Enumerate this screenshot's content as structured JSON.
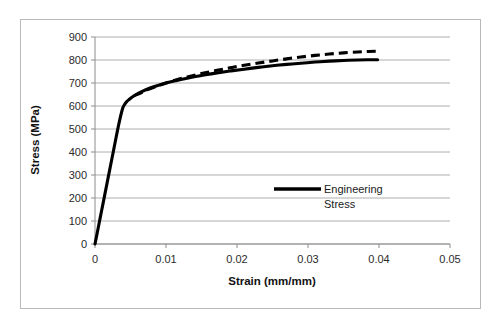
{
  "chart_data": {
    "type": "line",
    "title": "",
    "xlabel": "Strain (mm/mm)",
    "ylabel": "Stress (MPa)",
    "xlim": [
      0,
      0.05
    ],
    "ylim": [
      0,
      900
    ],
    "xticks": [
      "0",
      "0.01",
      "0.02",
      "0.03",
      "0.04",
      "0.05"
    ],
    "xtick_values": [
      0,
      0.01,
      0.02,
      0.03,
      0.04,
      0.05
    ],
    "yticks": [
      "0",
      "100",
      "200",
      "300",
      "400",
      "500",
      "600",
      "700",
      "800",
      "900"
    ],
    "ytick_values": [
      0,
      100,
      200,
      300,
      400,
      500,
      600,
      700,
      800,
      900
    ],
    "grid": "horizontal",
    "legend_position": "inside-right",
    "legend": [
      {
        "name": "Engineering Stress",
        "style": "solid",
        "color": "#000000"
      }
    ],
    "series": [
      {
        "name": "Engineering Stress",
        "style": "solid",
        "color": "#000000",
        "x": [
          0,
          0.0004,
          0.0009,
          0.0014,
          0.0019,
          0.0024,
          0.0029,
          0.0034,
          0.0039,
          0.0042,
          0.0045,
          0.0048,
          0.0052,
          0.0058,
          0.0065,
          0.0075,
          0.0085,
          0.01,
          0.0115,
          0.013,
          0.015,
          0.017,
          0.019,
          0.021,
          0.023,
          0.025,
          0.027,
          0.029,
          0.031,
          0.033,
          0.035,
          0.037,
          0.0385,
          0.0398
        ],
        "y": [
          0,
          62,
          140,
          218,
          296,
          374,
          452,
          528,
          590,
          608,
          620,
          628,
          638,
          650,
          661,
          675,
          686,
          700,
          711,
          721,
          733,
          743,
          752,
          760,
          768,
          775,
          781,
          786,
          791,
          795,
          798,
          800,
          801,
          801
        ]
      },
      {
        "name": "True Stress",
        "style": "dashed",
        "color": "#000000",
        "x": [
          0.0055,
          0.0065,
          0.0075,
          0.0085,
          0.01,
          0.0115,
          0.013,
          0.015,
          0.017,
          0.019,
          0.021,
          0.023,
          0.025,
          0.027,
          0.029,
          0.031,
          0.033,
          0.035,
          0.037,
          0.0385,
          0.0398
        ],
        "y": [
          645,
          657,
          672,
          684,
          700,
          714,
          726,
          741,
          754,
          766,
          777,
          787,
          796,
          805,
          813,
          820,
          826,
          831,
          835,
          837,
          838
        ]
      }
    ]
  },
  "axis_titles": {
    "x": "Strain (mm/mm)",
    "y": "Stress (MPa)"
  },
  "legend": {
    "line1": "Engineering",
    "line2": "Stress"
  }
}
